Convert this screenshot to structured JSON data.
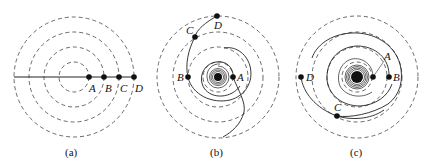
{
  "figure": {
    "panels": [
      {
        "id": "a",
        "caption": "(a)",
        "center": [
          74,
          77
        ],
        "guide_radii": [
          15,
          30,
          45,
          60
        ],
        "points": [
          {
            "label": "A",
            "x": 89,
            "y": 77
          },
          {
            "label": "B",
            "x": 104,
            "y": 77
          },
          {
            "label": "C",
            "x": 119,
            "y": 77
          },
          {
            "label": "D",
            "x": 134,
            "y": 77
          }
        ],
        "description": "Straight radial line of points A-D on concentric dashed circles"
      },
      {
        "id": "b",
        "caption": "(b)",
        "center": [
          218,
          77
        ],
        "guide_radii": [
          15,
          30,
          45,
          60
        ],
        "points": [
          {
            "label": "A",
            "x": 233,
            "y": 77
          },
          {
            "label": "B",
            "x": 188,
            "y": 77
          },
          {
            "label": "C",
            "x": 195,
            "y": 37
          },
          {
            "label": "D",
            "x": 217,
            "y": 16
          }
        ],
        "description": "Points wound into a spiral arm by differential rotation"
      },
      {
        "id": "c",
        "caption": "(c)",
        "center": [
          357,
          77
        ],
        "guide_radii": [
          15,
          30,
          45,
          60
        ],
        "points": [
          {
            "label": "A",
            "x": 373,
            "y": 77
          },
          {
            "label": "B",
            "x": 389,
            "y": 77
          },
          {
            "label": "C",
            "x": 337,
            "y": 116
          },
          {
            "label": "D",
            "x": 301,
            "y": 77
          }
        ],
        "description": "Spiral arm wound further after more rotation"
      }
    ]
  }
}
